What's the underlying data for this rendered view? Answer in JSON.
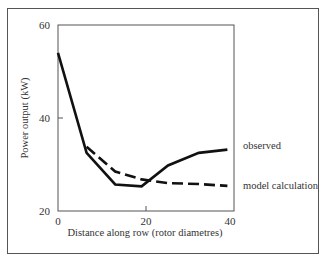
{
  "chart_data": {
    "type": "line",
    "title": "",
    "xlabel": "Distance along row (rotor diametres)",
    "ylabel": "Power output (kW)",
    "xlim": [
      0,
      40
    ],
    "ylim": [
      20,
      60
    ],
    "x_ticks": [
      "0",
      "20",
      "40"
    ],
    "y_ticks": [
      "20",
      "40",
      "60"
    ],
    "grid": false,
    "legend_position": "right (inline labels)",
    "series": [
      {
        "name": "observed",
        "style": "solid",
        "x": [
          0,
          6.5,
          13,
          19,
          25,
          32,
          38.5
        ],
        "values": [
          54,
          32.5,
          25.7,
          25.3,
          29.8,
          32.5,
          33.2
        ]
      },
      {
        "name": "model calculation",
        "style": "dashed",
        "x": [
          6.5,
          13,
          19,
          25,
          32,
          38.5
        ],
        "values": [
          33.8,
          28.5,
          26.8,
          26.0,
          25.8,
          25.4
        ]
      }
    ]
  },
  "labels": {
    "xlabel": "Distance along row (rotor diametres)",
    "ylabel": "Power output (kW)",
    "x0": "0",
    "x20": "20",
    "x40": "40",
    "y20": "20",
    "y40": "40",
    "y60": "60",
    "series1": "observed",
    "series2": "model calculation"
  }
}
